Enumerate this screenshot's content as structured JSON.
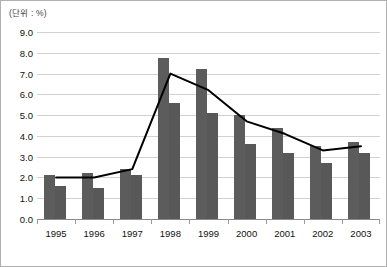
{
  "figure": {
    "unit_label": "(단위 : %)",
    "footnote": "",
    "border_color": "#b0b0b0",
    "bar_color_series1": "#5c5c5c",
    "bar_color_series2": "#585858",
    "line_color": "#000000",
    "gridline_color": "#d2d2d2"
  },
  "chart_data": {
    "type": "bar",
    "title": "",
    "subtitle": "",
    "xlabel": "",
    "ylabel": "",
    "annotations": [
      "(단위 : %)"
    ],
    "categories": [
      "1995",
      "1996",
      "1997",
      "1998",
      "1999",
      "2000",
      "2001",
      "2002",
      "2003"
    ],
    "ylim": [
      0.0,
      9.0
    ],
    "ytick_labels": [
      "0.0",
      "1.0",
      "2.0",
      "3.0",
      "4.0",
      "5.0",
      "6.0",
      "7.0",
      "8.0",
      "9.0"
    ],
    "ytick_values": [
      0.0,
      1.0,
      2.0,
      3.0,
      4.0,
      5.0,
      6.0,
      7.0,
      8.0,
      9.0
    ],
    "grid": true,
    "legend": "none",
    "series": [
      {
        "name": "bar-series-1",
        "type": "bar",
        "values": [
          2.1,
          2.2,
          2.4,
          7.75,
          7.2,
          5.0,
          4.4,
          3.5,
          3.7
        ]
      },
      {
        "name": "bar-series-2",
        "type": "bar",
        "values": [
          1.6,
          1.5,
          2.1,
          5.6,
          5.1,
          3.6,
          3.2,
          2.7,
          3.2
        ]
      },
      {
        "name": "line-series",
        "type": "line",
        "values": [
          2.0,
          2.0,
          2.4,
          7.0,
          6.2,
          4.7,
          4.1,
          3.3,
          3.5
        ]
      }
    ]
  }
}
